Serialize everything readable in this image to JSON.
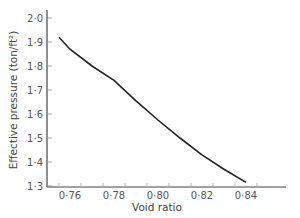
{
  "chart_data": {
    "type": "line",
    "title": "",
    "xlabel": "Void ratio",
    "ylabel": "Effective pressure (ton/ft²)",
    "xlim": [
      0.7525,
      0.8555
    ],
    "ylim": [
      1.3,
      2.0
    ],
    "xticks": [
      "0·76",
      "0·78",
      "0·80",
      "0·82",
      "0·84"
    ],
    "yticks": [
      "1·3",
      "1·4",
      "1·5",
      "1·6",
      "1·7",
      "1·8",
      "1·9",
      "2·0"
    ],
    "grid": false,
    "legend": null,
    "series": [
      {
        "name": "Effective pressure vs void ratio",
        "x": [
          0.755,
          0.76,
          0.77,
          0.78,
          0.79,
          0.8,
          0.81,
          0.82,
          0.83,
          0.84
        ],
        "y": [
          1.92,
          1.87,
          1.8,
          1.74,
          1.655,
          1.575,
          1.5,
          1.43,
          1.37,
          1.315
        ]
      }
    ]
  }
}
